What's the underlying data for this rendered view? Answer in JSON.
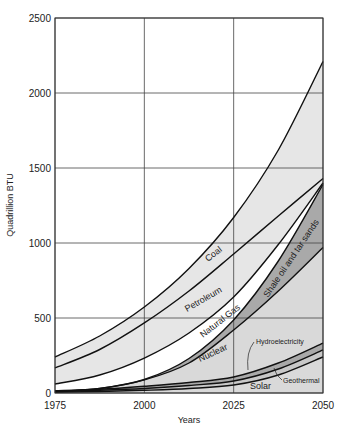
{
  "chart_data": {
    "type": "area",
    "title": "",
    "xlabel": "Years",
    "ylabel": "Quadrillion BTU",
    "x": [
      1975,
      1987.5,
      2000,
      2012.5,
      2025,
      2037.5,
      2050
    ],
    "xticks": [
      1975,
      2000,
      2025,
      2050
    ],
    "yticks": [
      0,
      500,
      1000,
      1500,
      2000,
      2500
    ],
    "ylim": [
      0,
      2500
    ],
    "xlim": [
      1975,
      2050
    ],
    "grid": true,
    "stacked_cumulative_tops": true,
    "series": [
      {
        "name": "Coal",
        "values": [
          240,
          380,
          573,
          830,
          1170,
          1620,
          2210
        ],
        "fill": "#e6e6e6"
      },
      {
        "name": "Petroleum",
        "values": [
          167,
          290,
          467,
          680,
          927,
          1180,
          1430
        ],
        "fill": "#e6e6e6"
      },
      {
        "name": "Natural Gas",
        "values": [
          60,
          120,
          233,
          400,
          640,
          990,
          1400
        ],
        "fill": "#ffffff"
      },
      {
        "name": "Shale oil and tar sands",
        "values": [
          10,
          30,
          90,
          230,
          487,
          880,
          1390
        ],
        "fill": "#a9a9a9"
      },
      {
        "name": "Nuclear",
        "values": [
          10,
          30,
          87,
          200,
          420,
          680,
          970
        ],
        "fill": "#d9d9d9"
      },
      {
        "name": "Hydroelectricity",
        "values": [
          15,
          25,
          45,
          70,
          107,
          200,
          333
        ],
        "fill": "#a9a9a9"
      },
      {
        "name": "Geothermal",
        "values": [
          10,
          18,
          30,
          50,
          80,
          160,
          287
        ],
        "fill": "#c8c8c8"
      },
      {
        "name": "Solar",
        "values": [
          5,
          10,
          18,
          30,
          53,
          120,
          240
        ],
        "fill": "#d9d9d9"
      }
    ],
    "labels": {
      "coal": "Coal",
      "petroleum": "Petroleum",
      "natural_gas": "Natural Gas",
      "shale": "Shale oil and tar sands",
      "nuclear": "Nuclear",
      "hydro": "Hydroelectricity",
      "geothermal": "Geothermal",
      "solar": "Solar"
    }
  }
}
